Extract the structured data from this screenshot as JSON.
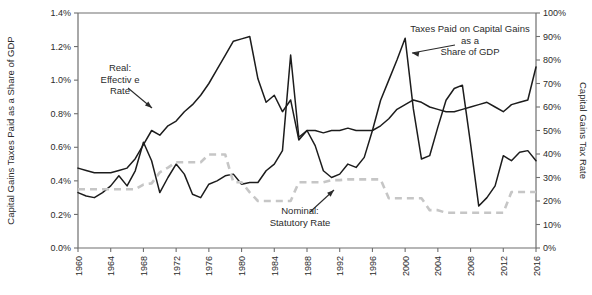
{
  "chart_data": {
    "type": "line",
    "title": "",
    "xlabel": "",
    "ylabel": "Capital Gains Taxes Paid as a Share of GDP",
    "y2label": "Capital Gains Tax Rate",
    "xlim": [
      1960,
      2016
    ],
    "ylim": [
      0.0,
      1.4
    ],
    "y2lim": [
      0,
      100
    ],
    "grid": false,
    "legend": "none (inline annotations)",
    "xticks": [
      1960,
      1964,
      1968,
      1972,
      1976,
      1980,
      1984,
      1988,
      1992,
      1996,
      2000,
      2004,
      2008,
      2012,
      2016
    ],
    "xtick_labels": [
      "1960",
      "1964",
      "1968",
      "1972",
      "1976",
      "1980",
      "1984",
      "1988",
      "1992",
      "1996",
      "2000",
      "2004",
      "2008",
      "2012",
      "2016"
    ],
    "yticks": [
      0.0,
      0.2,
      0.4,
      0.6,
      0.8,
      1.0,
      1.2,
      1.4
    ],
    "ytick_labels": [
      "0.0%",
      "0.2%",
      "0.4%",
      "0.6%",
      "0.8%",
      "1.0%",
      "1.2%",
      "1.4%"
    ],
    "y2ticks": [
      0,
      10,
      20,
      30,
      40,
      50,
      60,
      70,
      80,
      90,
      100
    ],
    "y2tick_labels": [
      "0%",
      "10%",
      "20%",
      "30%",
      "40%",
      "50%",
      "60%",
      "70%",
      "80%",
      "90%",
      "100%"
    ],
    "x": [
      1960,
      1961,
      1962,
      1963,
      1964,
      1965,
      1966,
      1967,
      1968,
      1969,
      1970,
      1971,
      1972,
      1973,
      1974,
      1975,
      1976,
      1977,
      1978,
      1979,
      1980,
      1981,
      1982,
      1983,
      1984,
      1985,
      1986,
      1987,
      1988,
      1989,
      1990,
      1991,
      1992,
      1993,
      1994,
      1995,
      1996,
      1997,
      1998,
      1999,
      2000,
      2001,
      2002,
      2003,
      2004,
      2005,
      2006,
      2007,
      2008,
      2009,
      2010,
      2011,
      2012,
      2013,
      2014,
      2015,
      2016
    ],
    "series": [
      {
        "name": "Real: Effective Rate",
        "axis": "right",
        "color": "#1c1c1c",
        "style": "solid",
        "unit": "%",
        "values": [
          34,
          33,
          32,
          32,
          32,
          33,
          34,
          38,
          44,
          50,
          48,
          52,
          54,
          58,
          61,
          65,
          70,
          76,
          82,
          88,
          89,
          90,
          72,
          62,
          65,
          58,
          63,
          46,
          50,
          50,
          49,
          50,
          50,
          51,
          50,
          50,
          50,
          52,
          55,
          59,
          61,
          63,
          62,
          60,
          59,
          58,
          58,
          59,
          60,
          61,
          62,
          60,
          58,
          61,
          62,
          63,
          77
        ]
      },
      {
        "name": "Taxes Paid on Capital Gains as a Share of GDP",
        "axis": "left",
        "color": "#1c1c1c",
        "style": "solid",
        "unit": "% of GDP",
        "values": [
          0.33,
          0.31,
          0.3,
          0.33,
          0.37,
          0.43,
          0.37,
          0.46,
          0.63,
          0.52,
          0.33,
          0.42,
          0.5,
          0.44,
          0.32,
          0.3,
          0.38,
          0.4,
          0.43,
          0.44,
          0.38,
          0.39,
          0.39,
          0.46,
          0.5,
          0.58,
          1.15,
          0.66,
          0.7,
          0.61,
          0.46,
          0.42,
          0.44,
          0.5,
          0.48,
          0.54,
          0.7,
          0.88,
          1.0,
          1.12,
          1.25,
          0.83,
          0.53,
          0.55,
          0.72,
          0.88,
          0.95,
          0.97,
          0.62,
          0.25,
          0.3,
          0.37,
          0.55,
          0.52,
          0.57,
          0.58,
          0.52
        ]
      },
      {
        "name": "Nominal: Statutory Rate",
        "axis": "right",
        "color": "#c6c6c6",
        "style": "dashed",
        "unit": "%",
        "values": [
          25,
          25,
          25,
          25,
          25,
          25,
          25,
          25,
          27,
          27.5,
          32.2,
          34.2,
          36.5,
          36.5,
          36.5,
          36.5,
          39.8,
          39.8,
          39.8,
          28,
          28,
          23.7,
          20,
          20,
          20,
          20,
          20,
          28,
          28,
          28,
          28,
          28.9,
          28.9,
          29.2,
          29.2,
          29.2,
          29.2,
          29.2,
          21.2,
          21.2,
          21.2,
          21.2,
          21.2,
          16.1,
          16.1,
          15,
          15,
          15,
          15,
          15,
          15,
          15,
          15,
          23.8,
          23.8,
          23.8,
          23.8
        ]
      }
    ],
    "annotations": [
      {
        "id": "real-effective-rate",
        "lines": [
          "Real:",
          "Effectiv e",
          "Rate"
        ]
      },
      {
        "id": "taxes-paid-share-gdp",
        "lines": [
          "Taxes Paid on Capital Gains",
          "as a",
          "Share of GDP"
        ]
      },
      {
        "id": "nominal-statutory-rate",
        "lines": [
          "Nominal:",
          "Statutory Rate"
        ]
      }
    ]
  }
}
